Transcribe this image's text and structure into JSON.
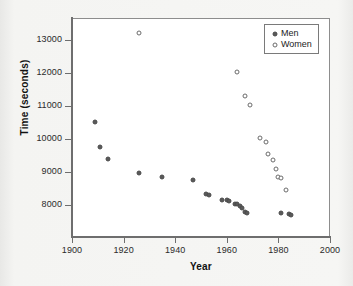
{
  "figure": {
    "title": "",
    "background_color": "#f2f2f0",
    "plot_background_color": "#ffffff",
    "axis_color": "#6e6e6e"
  },
  "axes": {
    "x_title": "Year",
    "y_title": "Time (seconds)",
    "x_ticks": [
      "1900",
      "1920",
      "1940",
      "1960",
      "1980",
      "2000"
    ],
    "y_ticks": [
      "8000",
      "9000",
      "10000",
      "11000",
      "12000",
      "13000"
    ]
  },
  "legend": {
    "position": "top-right",
    "entries": [
      {
        "label": "Men",
        "marker": "filled-circle",
        "color": "#595959"
      },
      {
        "label": "Women",
        "marker": "open-circle",
        "color": "#6b6b6b"
      }
    ]
  },
  "chart_data": {
    "type": "scatter",
    "title": "",
    "xlabel": "Year",
    "ylabel": "Time (seconds)",
    "xlim": [
      1900,
      2000
    ],
    "ylim": [
      7400,
      13500
    ],
    "grid": false,
    "legend_position": "top-right",
    "series": [
      {
        "name": "Men",
        "marker": "filled-circle",
        "color": "#595959",
        "points": [
          [
            1909,
            10530
          ],
          [
            1911,
            9750
          ],
          [
            1914,
            9400
          ],
          [
            1926,
            8970
          ],
          [
            1935,
            8840
          ],
          [
            1947,
            8750
          ],
          [
            1952,
            8340
          ],
          [
            1953,
            8290
          ],
          [
            1958,
            8140
          ],
          [
            1960,
            8140
          ],
          [
            1961,
            8130
          ],
          [
            1963,
            8030
          ],
          [
            1964,
            8020
          ],
          [
            1965,
            7960
          ],
          [
            1966,
            7900
          ],
          [
            1967,
            7800
          ],
          [
            1968,
            7760
          ],
          [
            1981,
            7760
          ],
          [
            1984,
            7730
          ],
          [
            1985,
            7690
          ]
        ]
      },
      {
        "name": "Women",
        "marker": "open-circle",
        "color": "#6b6b6b",
        "points": [
          [
            1926,
            13200
          ],
          [
            1964,
            12020
          ],
          [
            1967,
            11290
          ],
          [
            1969,
            11020
          ],
          [
            1973,
            10040
          ],
          [
            1975,
            9920
          ],
          [
            1976,
            9560
          ],
          [
            1978,
            9350
          ],
          [
            1979,
            9080
          ],
          [
            1980,
            8840
          ],
          [
            1981,
            8820
          ],
          [
            1983,
            8450
          ]
        ]
      }
    ]
  }
}
